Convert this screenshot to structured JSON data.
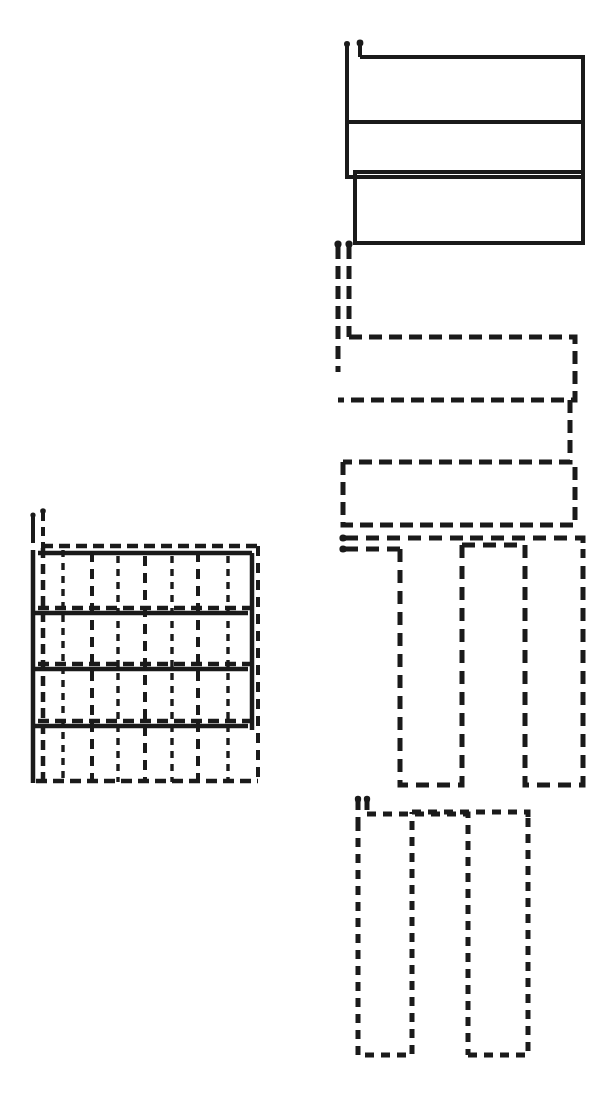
{
  "figure": {
    "title": "Serpentine scan path patterns and composite grid",
    "canvas": {
      "width": 613,
      "height": 1094
    },
    "background_color": "#ffffff",
    "ink_color": "#1a1a1a"
  },
  "chart_data": {
    "type": "line",
    "title": "Serpentine scan path patterns and composite grid",
    "xlabel": "",
    "ylabel": "",
    "grid": false,
    "legend_position": "none",
    "xlim": [
      0,
      613
    ],
    "ylim": [
      0,
      1094
    ],
    "series": [
      {
        "name": "composite-grid",
        "label": "Composite grid (superimposed passes)",
        "line_style": "mixed",
        "stroke_width": 4,
        "color": "#1a1a1a",
        "notes": "4 x 4 cell lattice formed by overlaying all four serpentine passes",
        "bounds": {
          "x": 30,
          "y": 540,
          "width": 230,
          "height": 240
        },
        "columns": 4,
        "rows": 4
      },
      {
        "name": "pattern-1-horizontal-solid",
        "label": "Pattern 1 - horizontal serpentine, solid",
        "line_style": "solid",
        "stroke_width": 4,
        "color": "#1a1a1a",
        "sweeps": 3,
        "orientation": "horizontal",
        "bounds": {
          "x": 345,
          "y": 40,
          "width": 240,
          "height": 205
        },
        "points": [
          [
            347,
            42
          ],
          [
            347,
            64
          ],
          [
            360,
            42
          ],
          [
            360,
            57
          ],
          [
            360,
            57
          ],
          [
            583,
            57
          ],
          [
            583,
            57
          ],
          [
            583,
            122
          ],
          [
            583,
            122
          ],
          [
            347,
            122
          ],
          [
            347,
            122
          ],
          [
            347,
            177
          ],
          [
            347,
            177
          ],
          [
            580,
            177
          ],
          [
            580,
            177
          ],
          [
            580,
            172
          ],
          [
            355,
            172
          ],
          [
            355,
            243
          ],
          [
            355,
            243
          ],
          [
            583,
            243
          ],
          [
            583,
            243
          ],
          [
            583,
            172
          ]
        ]
      },
      {
        "name": "pattern-2-horizontal-dashed",
        "label": "Pattern 2 - horizontal serpentine, dashed",
        "line_style": "dashed",
        "stroke_width": 5,
        "dash_pattern": "13 7",
        "color": "#1a1a1a",
        "sweeps": 3,
        "orientation": "horizontal",
        "bounds": {
          "x": 335,
          "y": 240,
          "width": 245,
          "height": 290
        },
        "points": [
          [
            338,
            243
          ],
          [
            338,
            370
          ],
          [
            348,
            243
          ],
          [
            348,
            337
          ],
          [
            348,
            337
          ],
          [
            575,
            337
          ],
          [
            575,
            337
          ],
          [
            575,
            400
          ],
          [
            575,
            400
          ],
          [
            338,
            400
          ],
          [
            338,
            400
          ],
          [
            338,
            370
          ],
          [
            570,
            400
          ],
          [
            570,
            462
          ],
          [
            570,
            462
          ],
          [
            343,
            462
          ],
          [
            343,
            462
          ],
          [
            343,
            525
          ],
          [
            343,
            525
          ],
          [
            575,
            525
          ],
          [
            575,
            525
          ],
          [
            575,
            462
          ]
        ]
      },
      {
        "name": "pattern-3-vertical-dashed",
        "label": "Pattern 3 - vertical serpentine, dashed",
        "line_style": "dashed",
        "stroke_width": 5,
        "dash_pattern": "13 8",
        "color": "#1a1a1a",
        "sweeps": 4,
        "orientation": "vertical",
        "bounds": {
          "x": 340,
          "y": 535,
          "width": 245,
          "height": 255
        },
        "points": [
          [
            342,
            538
          ],
          [
            470,
            538
          ],
          [
            342,
            548
          ],
          [
            400,
            548
          ],
          [
            400,
            548
          ],
          [
            400,
            785
          ],
          [
            400,
            785
          ],
          [
            462,
            785
          ],
          [
            462,
            785
          ],
          [
            462,
            545
          ],
          [
            462,
            545
          ],
          [
            525,
            545
          ],
          [
            525,
            545
          ],
          [
            525,
            785
          ],
          [
            525,
            785
          ],
          [
            583,
            785
          ],
          [
            583,
            785
          ],
          [
            583,
            548
          ]
        ]
      },
      {
        "name": "pattern-4-vertical-dashed-fine",
        "label": "Pattern 4 - vertical serpentine, fine dashed",
        "line_style": "dashed",
        "stroke_width": 5,
        "dash_pattern": "9 7",
        "color": "#1a1a1a",
        "sweeps": 4,
        "orientation": "vertical",
        "bounds": {
          "x": 355,
          "y": 795,
          "width": 180,
          "height": 265
        },
        "points": [
          [
            358,
            798
          ],
          [
            358,
            820
          ],
          [
            366,
            798
          ],
          [
            366,
            812
          ],
          [
            358,
            820
          ],
          [
            358,
            1055
          ],
          [
            358,
            1055
          ],
          [
            412,
            1055
          ],
          [
            412,
            1055
          ],
          [
            412,
            812
          ],
          [
            412,
            812
          ],
          [
            468,
            812
          ],
          [
            468,
            812
          ],
          [
            468,
            1055
          ],
          [
            468,
            1055
          ],
          [
            528,
            1055
          ],
          [
            528,
            1055
          ],
          [
            528,
            818
          ]
        ]
      }
    ],
    "annotations": [
      {
        "name": "start-stub-pattern-1",
        "x": 347,
        "y": 42,
        "kind": "dot-terminated-stub",
        "count": 2
      },
      {
        "name": "start-stub-pattern-2",
        "x": 338,
        "y": 243,
        "kind": "dot-terminated-stub",
        "count": 2
      },
      {
        "name": "start-stub-pattern-3",
        "x": 342,
        "y": 538,
        "kind": "dot-terminated-stub",
        "count": 2
      },
      {
        "name": "start-stub-pattern-4",
        "x": 358,
        "y": 798,
        "kind": "dot-terminated-stub",
        "count": 2
      },
      {
        "name": "start-stub-grid",
        "x": 33,
        "y": 512,
        "kind": "dot-terminated-stub",
        "count": 2
      }
    ]
  }
}
